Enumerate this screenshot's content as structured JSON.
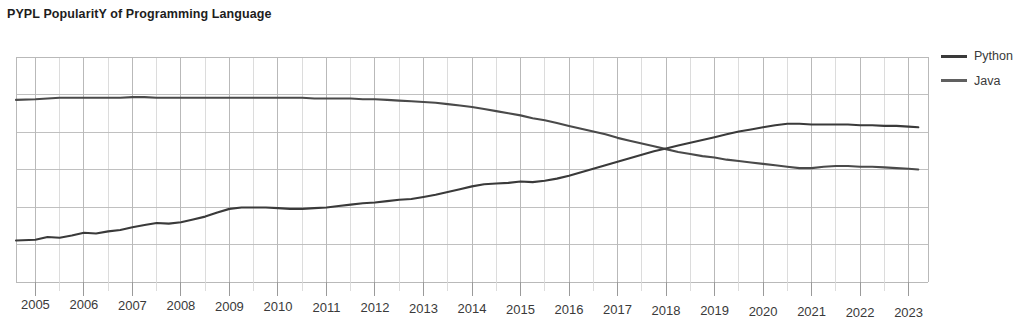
{
  "chart_data": {
    "type": "line",
    "title": "PYPL PopularitY of Programming Language",
    "xlabel": "",
    "ylabel": "",
    "grid": true,
    "legend_position": "right",
    "xlim": [
      2004.6,
      2023.4
    ],
    "ylim": [
      0,
      32
    ],
    "xticks": [
      "2005",
      "2006",
      "2007",
      "2008",
      "2009",
      "2010",
      "2011",
      "2012",
      "2013",
      "2014",
      "2015",
      "2016",
      "2017",
      "2018",
      "2019",
      "2020",
      "2021",
      "2022",
      "2023"
    ],
    "yticks": [],
    "x": [
      2004.6,
      2005.0,
      2005.25,
      2005.5,
      2005.75,
      2006.0,
      2006.25,
      2006.5,
      2006.75,
      2007.0,
      2007.25,
      2007.5,
      2007.75,
      2008.0,
      2008.25,
      2008.5,
      2008.75,
      2009.0,
      2009.25,
      2009.5,
      2009.75,
      2010.0,
      2010.25,
      2010.5,
      2010.75,
      2011.0,
      2011.25,
      2011.5,
      2011.75,
      2012.0,
      2012.25,
      2012.5,
      2012.75,
      2013.0,
      2013.25,
      2013.5,
      2013.75,
      2014.0,
      2014.25,
      2014.5,
      2014.75,
      2015.0,
      2015.25,
      2015.5,
      2015.75,
      2016.0,
      2016.25,
      2016.5,
      2016.75,
      2017.0,
      2017.25,
      2017.5,
      2017.75,
      2018.0,
      2018.25,
      2018.5,
      2018.75,
      2019.0,
      2019.25,
      2019.5,
      2019.75,
      2020.0,
      2020.25,
      2020.5,
      2020.75,
      2021.0,
      2021.25,
      2021.5,
      2021.75,
      2022.0,
      2022.25,
      2022.5,
      2022.75,
      2023.0,
      2023.2
    ],
    "series": [
      {
        "name": "Java",
        "color": "#4a4a4a",
        "values": [
          25.9,
          26.0,
          26.1,
          26.2,
          26.2,
          26.2,
          26.2,
          26.2,
          26.2,
          26.3,
          26.3,
          26.2,
          26.2,
          26.2,
          26.2,
          26.2,
          26.2,
          26.2,
          26.2,
          26.2,
          26.2,
          26.2,
          26.2,
          26.2,
          26.1,
          26.1,
          26.1,
          26.1,
          26.0,
          26.0,
          25.9,
          25.8,
          25.7,
          25.6,
          25.5,
          25.3,
          25.1,
          24.9,
          24.6,
          24.3,
          24.0,
          23.7,
          23.3,
          23.0,
          22.6,
          22.2,
          21.8,
          21.4,
          21.0,
          20.5,
          20.1,
          19.7,
          19.3,
          18.9,
          18.5,
          18.2,
          17.9,
          17.7,
          17.4,
          17.2,
          17.0,
          16.8,
          16.6,
          16.4,
          16.2,
          16.2,
          16.4,
          16.5,
          16.5,
          16.4,
          16.4,
          16.3,
          16.2,
          16.1,
          16.0
        ]
      },
      {
        "name": "Python",
        "color": "#3a3a3a",
        "values": [
          5.9,
          6.0,
          6.4,
          6.3,
          6.6,
          7.0,
          6.9,
          7.2,
          7.4,
          7.8,
          8.1,
          8.4,
          8.3,
          8.5,
          8.9,
          9.3,
          9.9,
          10.4,
          10.6,
          10.6,
          10.6,
          10.5,
          10.4,
          10.4,
          10.5,
          10.6,
          10.8,
          11.0,
          11.2,
          11.3,
          11.5,
          11.7,
          11.8,
          12.1,
          12.4,
          12.8,
          13.2,
          13.6,
          13.9,
          14.0,
          14.1,
          14.3,
          14.2,
          14.4,
          14.7,
          15.1,
          15.6,
          16.1,
          16.6,
          17.1,
          17.6,
          18.1,
          18.6,
          19.0,
          19.4,
          19.8,
          20.2,
          20.6,
          21.0,
          21.4,
          21.7,
          22.0,
          22.3,
          22.5,
          22.5,
          22.4,
          22.4,
          22.4,
          22.4,
          22.3,
          22.3,
          22.2,
          22.2,
          22.1,
          22.0
        ]
      }
    ]
  },
  "title": {
    "text": "PYPL PopularitY of Programming Language"
  },
  "legend": {
    "items": [
      {
        "label": "Python",
        "color": "#3a3a3a",
        "name": "legend-item-python"
      },
      {
        "label": "Java",
        "color": "#606060",
        "name": "legend-item-java"
      }
    ]
  },
  "axis": {
    "x_labels": [
      "2005",
      "2006",
      "2007",
      "2008",
      "2009",
      "2010",
      "2011",
      "2012",
      "2013",
      "2014",
      "2015",
      "2016",
      "2017",
      "2018",
      "2019",
      "2020",
      "2021",
      "2022",
      "2023"
    ]
  },
  "style": {
    "grid_color": "#b9b9b9",
    "grid_minor_color": "#d8d8d8",
    "axis_color": "#9a9a9a",
    "background": "#ffffff"
  }
}
